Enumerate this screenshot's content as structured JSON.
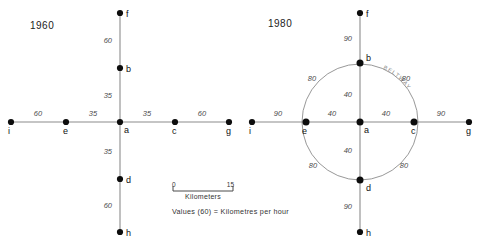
{
  "figure": {
    "top_artifact_text": "",
    "panels": [
      {
        "id": "panel-1960",
        "year_label": "1960",
        "nodes": [
          {
            "id": "f",
            "label": "f",
            "x": 120,
            "y": 13
          },
          {
            "id": "b",
            "label": "b",
            "x": 120,
            "y": 68
          },
          {
            "id": "a",
            "label": "a",
            "x": 120,
            "y": 122
          },
          {
            "id": "d",
            "label": "d",
            "x": 120,
            "y": 179
          },
          {
            "id": "h",
            "label": "h",
            "x": 120,
            "y": 232
          },
          {
            "id": "i",
            "label": "i",
            "x": 11,
            "y": 122
          },
          {
            "id": "e",
            "label": "e",
            "x": 66,
            "y": 122
          },
          {
            "id": "c",
            "label": "c",
            "x": 175,
            "y": 122
          },
          {
            "id": "g",
            "label": "g",
            "x": 229,
            "y": 122
          }
        ],
        "edges": [
          {
            "from": "f",
            "to": "b",
            "value": "60",
            "label_x": 112,
            "label_y": 43
          },
          {
            "from": "b",
            "to": "a",
            "value": "35",
            "label_x": 112,
            "label_y": 98
          },
          {
            "from": "a",
            "to": "d",
            "value": "35",
            "label_x": 112,
            "label_y": 154
          },
          {
            "from": "d",
            "to": "h",
            "value": "60",
            "label_x": 112,
            "label_y": 208
          },
          {
            "from": "i",
            "to": "e",
            "value": "60",
            "label_x": 38,
            "label_y": 116
          },
          {
            "from": "e",
            "to": "a",
            "value": "35",
            "label_x": 93,
            "label_y": 116
          },
          {
            "from": "a",
            "to": "c",
            "value": "35",
            "label_x": 147,
            "label_y": 116
          },
          {
            "from": "c",
            "to": "g",
            "value": "60",
            "label_x": 202,
            "label_y": 116
          }
        ],
        "beltway": null
      },
      {
        "id": "panel-1980",
        "year_label": "1980",
        "nodes": [
          {
            "id": "f",
            "label": "f",
            "x": 360,
            "y": 13
          },
          {
            "id": "b",
            "label": "b",
            "x": 360,
            "y": 63
          },
          {
            "id": "a",
            "label": "a",
            "x": 360,
            "y": 122
          },
          {
            "id": "d",
            "label": "d",
            "x": 360,
            "y": 180
          },
          {
            "id": "h",
            "label": "h",
            "x": 360,
            "y": 232
          },
          {
            "id": "i",
            "label": "i",
            "x": 252,
            "y": 122
          },
          {
            "id": "e",
            "label": "e",
            "x": 306,
            "y": 122
          },
          {
            "id": "c",
            "label": "c",
            "x": 414,
            "y": 122
          },
          {
            "id": "g",
            "label": "g",
            "x": 469,
            "y": 122
          }
        ],
        "edges": [
          {
            "from": "f",
            "to": "b",
            "value": "90",
            "label_x": 352,
            "label_y": 41
          },
          {
            "from": "b",
            "to": "a",
            "value": "40",
            "label_x": 352,
            "label_y": 97
          },
          {
            "from": "a",
            "to": "d",
            "value": "40",
            "label_x": 352,
            "label_y": 153
          },
          {
            "from": "d",
            "to": "h",
            "value": "90",
            "label_x": 352,
            "label_y": 209
          },
          {
            "from": "i",
            "to": "e",
            "value": "90",
            "label_x": 278,
            "label_y": 116
          },
          {
            "from": "e",
            "to": "a",
            "value": "40",
            "label_x": 332,
            "label_y": 116
          },
          {
            "from": "a",
            "to": "c",
            "value": "40",
            "label_x": 386,
            "label_y": 116
          },
          {
            "from": "c",
            "to": "g",
            "value": "90",
            "label_x": 441,
            "label_y": 116
          }
        ],
        "beltway": {
          "label": "BELTWAY",
          "center_x": 360,
          "center_y": 122,
          "radius": 58,
          "arc_values": [
            {
              "value": "80",
              "label_x": 312,
              "label_y": 81
            },
            {
              "value": "80",
              "label_x": 406,
              "label_y": 81
            },
            {
              "value": "80",
              "label_x": 313,
              "label_y": 168
            },
            {
              "value": "80",
              "label_x": 404,
              "label_y": 168
            }
          ]
        }
      }
    ],
    "scale_bar": {
      "min_label": "0",
      "max_label": "15",
      "caption": "Kilometers",
      "x": 172,
      "y": 188,
      "width": 62
    },
    "legend_note": "Values (60) = Kilometres per hour"
  }
}
